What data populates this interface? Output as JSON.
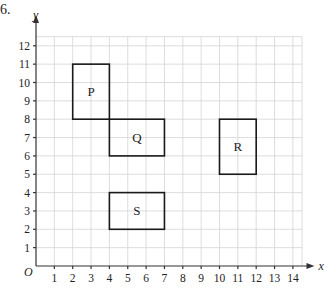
{
  "question_number": "6.",
  "chart_data": {
    "type": "coordinate-grid",
    "xlabel": "x",
    "ylabel": "y",
    "origin_label": "O",
    "xlim": [
      0,
      14
    ],
    "ylim": [
      0,
      12
    ],
    "x_ticks": [
      "1",
      "2",
      "3",
      "4",
      "5",
      "6",
      "7",
      "8",
      "9",
      "10",
      "11",
      "12",
      "13",
      "14"
    ],
    "y_ticks": [
      "1",
      "2",
      "3",
      "4",
      "5",
      "6",
      "7",
      "8",
      "9",
      "10",
      "11",
      "12"
    ],
    "grid": true,
    "shapes": [
      {
        "label": "P",
        "x1": 2,
        "y1": 8,
        "x2": 4,
        "y2": 11
      },
      {
        "label": "Q",
        "x1": 4,
        "y1": 6,
        "x2": 7,
        "y2": 8
      },
      {
        "label": "R",
        "x1": 10,
        "y1": 5,
        "x2": 12,
        "y2": 8
      },
      {
        "label": "S",
        "x1": 4,
        "y1": 2,
        "x2": 7,
        "y2": 4
      }
    ]
  }
}
